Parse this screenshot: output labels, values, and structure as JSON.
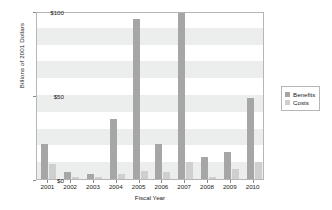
{
  "chart_data": {
    "type": "bar",
    "title": "",
    "xlabel": "Fiscal Year",
    "ylabel": "Billions of 2001 Dollars",
    "categories": [
      "2001",
      "2002",
      "2003",
      "2004",
      "2005",
      "2006",
      "2007",
      "2008",
      "2009",
      "2010"
    ],
    "series": [
      {
        "name": "Benefits",
        "color": "#a6a6a6",
        "values": [
          21,
          4,
          3,
          36,
          95,
          21,
          99,
          13,
          16,
          48
        ]
      },
      {
        "name": "Costs",
        "color": "#cfcfcf",
        "values": [
          9,
          1,
          1,
          3,
          5,
          4,
          10,
          1,
          6,
          10
        ]
      }
    ],
    "ylim": [
      0,
      100
    ],
    "ytick_labels": [
      "$0",
      "$50",
      "$100"
    ],
    "ytick_values": [
      0,
      50,
      100
    ],
    "grid": false,
    "banded_background": true,
    "band_interval": 10,
    "legend_position": "right"
  },
  "legend": {
    "entries": [
      {
        "label": "Benefits"
      },
      {
        "label": "Costs"
      }
    ]
  },
  "colors": {
    "benefits": "#a6a6a6",
    "costs": "#cfcfcf",
    "band": "#eceded",
    "axis": "#b6b6b6",
    "background": "#ffffff"
  }
}
